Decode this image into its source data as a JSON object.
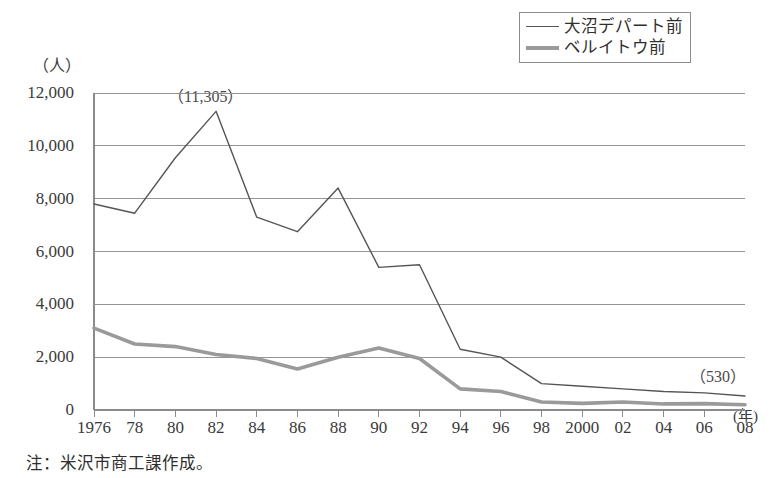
{
  "figure": {
    "title_strip": "",
    "footnote": "注：米沢市商工課作成。"
  },
  "legend": {
    "position": "top-right",
    "items": [
      {
        "label": "大沼デパート前",
        "style": "thin-solid",
        "color": "#555555"
      },
      {
        "label": "ベルイトウ前",
        "style": "thick-solid",
        "color": "#9a9a9a"
      }
    ]
  },
  "axes": {
    "y_unit": "（人）",
    "x_unit": "(年)",
    "y_ticks": [
      "12,000",
      "10,000",
      "8,000",
      "6,000",
      "4,000",
      "2,000",
      "0"
    ],
    "x_ticks": [
      "1976",
      "78",
      "80",
      "82",
      "84",
      "86",
      "88",
      "90",
      "92",
      "94",
      "96",
      "98",
      "2000",
      "02",
      "04",
      "06",
      "08"
    ]
  },
  "annotations": [
    {
      "name": "peak-value",
      "text": "（11,305）"
    },
    {
      "name": "end-value",
      "text": "（530）"
    }
  ],
  "chart_data": {
    "type": "line",
    "title": "",
    "xlabel": "(年)",
    "ylabel": "（人）",
    "ylim": [
      0,
      12000
    ],
    "ytick_step": 2000,
    "grid": true,
    "legend_position": "top-right",
    "categories": [
      1976,
      1978,
      1980,
      1982,
      1984,
      1986,
      1988,
      1990,
      1992,
      1994,
      1996,
      1998,
      2000,
      2002,
      2004,
      2006,
      2008
    ],
    "series": [
      {
        "name": "大沼デパート前",
        "color": "#555555",
        "width": 1.4,
        "values": [
          7800,
          7450,
          9550,
          11305,
          7300,
          6750,
          8400,
          5400,
          5500,
          2300,
          2000,
          1000,
          900,
          800,
          700,
          650,
          530
        ]
      },
      {
        "name": "ベルイトウ前",
        "color": "#9a9a9a",
        "width": 3.6,
        "values": [
          3100,
          2500,
          2400,
          2100,
          1950,
          1550,
          2000,
          2350,
          1950,
          800,
          700,
          300,
          250,
          300,
          230,
          240,
          200
        ]
      }
    ],
    "data_labels": [
      {
        "series": "大沼デパート前",
        "x": 1982,
        "text": "（11,305）"
      },
      {
        "series": "大沼デパート前",
        "x": 2008,
        "text": "（530）"
      }
    ]
  }
}
